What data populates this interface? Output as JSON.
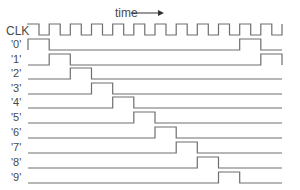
{
  "diagram": {
    "type": "timing-diagram",
    "time_label": "time",
    "time_arrow": "→",
    "clock": {
      "label": "CLK",
      "x_start": 27,
      "x_end": 282,
      "high_y": 24,
      "low_y": 35,
      "periods": 12
    },
    "period_px": 21.2,
    "pulse_height_px": 11,
    "signals": [
      {
        "label": "'0'",
        "low_y": 50,
        "high_periods": [
          0,
          10
        ]
      },
      {
        "label": "'1'",
        "low_y": 65,
        "high_periods": [
          1,
          11
        ]
      },
      {
        "label": "'2'",
        "low_y": 79,
        "high_periods": [
          2
        ]
      },
      {
        "label": "'3'",
        "low_y": 94,
        "high_periods": [
          3
        ]
      },
      {
        "label": "'4'",
        "low_y": 108,
        "high_periods": [
          4
        ]
      },
      {
        "label": "'5'",
        "low_y": 123,
        "high_periods": [
          5
        ]
      },
      {
        "label": "'6'",
        "low_y": 138,
        "high_periods": [
          6
        ]
      },
      {
        "label": "'7'",
        "low_y": 153,
        "high_periods": [
          7
        ]
      },
      {
        "label": "'8'",
        "low_y": 168,
        "high_periods": [
          8
        ]
      },
      {
        "label": "'9'",
        "low_y": 183,
        "high_periods": [
          9
        ]
      }
    ],
    "colors": {
      "waveform": "#6e6e6e",
      "label": "#4a4a4a",
      "background": "#ffffff"
    }
  }
}
